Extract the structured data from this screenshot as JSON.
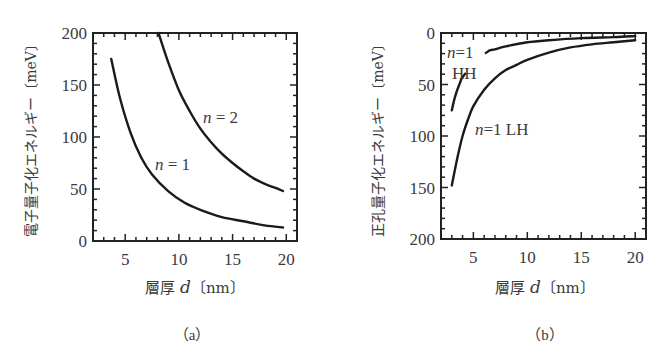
{
  "chart_data": [
    {
      "panel": "a",
      "type": "line",
      "caption": "（a）",
      "xlabel": "層厚 d〔nm〕",
      "xlabel_parts": {
        "prefix": "層厚 ",
        "var": "d",
        "unit": "〔nm〕"
      },
      "ylabel": "電子量子化エネルギー〔meV〕",
      "xlim": [
        2,
        21
      ],
      "ylim": [
        0,
        200
      ],
      "y_inverted": false,
      "xticks": [
        5,
        10,
        15,
        20
      ],
      "yticks": [
        0,
        50,
        100,
        150,
        200
      ],
      "grid": false,
      "legend": "inline labels",
      "series": [
        {
          "name": "n=1",
          "label": "n = 1",
          "x": [
            3.7,
            4.5,
            5.5,
            6.5,
            7.5,
            9,
            10.5,
            12,
            14,
            16,
            18,
            19.7
          ],
          "y": [
            175,
            138,
            104,
            80,
            64,
            48,
            37,
            30,
            23,
            19,
            15,
            13
          ]
        },
        {
          "name": "n=2",
          "label": "n = 2",
          "x": [
            8.1,
            9,
            10,
            11,
            12,
            13,
            14,
            15,
            16,
            17,
            18,
            19,
            19.7
          ],
          "y": [
            200,
            172,
            145,
            125,
            108,
            95,
            84,
            75,
            67,
            60,
            55,
            51,
            48
          ]
        }
      ]
    },
    {
      "panel": "b",
      "type": "line",
      "caption": "（b）",
      "xlabel": "層厚 d〔nm〕",
      "xlabel_parts": {
        "prefix": "層厚 ",
        "var": "d",
        "unit": "〔nm〕"
      },
      "ylabel": "正孔量子化エネルギー〔meV〕",
      "xlim": [
        2,
        21
      ],
      "ylim": [
        0,
        200
      ],
      "y_inverted": true,
      "xticks": [
        5,
        10,
        15,
        20
      ],
      "yticks": [
        0,
        50,
        100,
        150,
        200
      ],
      "grid": false,
      "legend": "inline labels",
      "series": [
        {
          "name": "n=1 HH",
          "label_top": "n=1",
          "label_bottom": "HH",
          "x": [
            3,
            3.3,
            3.7,
            4.2,
            6.2,
            7,
            8,
            10,
            12,
            15,
            18,
            20
          ],
          "y": [
            75,
            62,
            50,
            40,
            19,
            16,
            13,
            9,
            7,
            5,
            4,
            3
          ]
        },
        {
          "name": "n=1 LH",
          "label": "n=1 LH",
          "x": [
            3,
            3.5,
            4,
            4.5,
            5,
            6,
            7,
            8,
            9,
            10,
            12,
            14,
            16,
            18,
            20
          ],
          "y": [
            148,
            122,
            100,
            84,
            71,
            55,
            44,
            36,
            31,
            26,
            19,
            14,
            11,
            9,
            7
          ]
        }
      ]
    }
  ]
}
